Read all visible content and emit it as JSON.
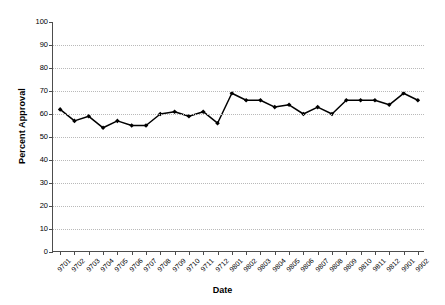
{
  "chart_data": {
    "type": "line",
    "title": "",
    "xlabel": "Date",
    "ylabel": "Percent Approval",
    "ylim": [
      0,
      100
    ],
    "ytick_step": 10,
    "yticks": [
      100,
      90,
      80,
      70,
      60,
      50,
      40,
      30,
      20,
      10,
      0
    ],
    "grid": true,
    "legend": "none",
    "marker": "filled-diamond",
    "line_color": "#000000",
    "marker_color": "#000000",
    "gridline_color": "#b9b9b9",
    "axis_color": "#4d4d4d",
    "background": "#ffffff",
    "categories": [
      "9701",
      "9702",
      "9703",
      "9704",
      "9705",
      "9706",
      "9707",
      "9708",
      "9709",
      "9710",
      "9711",
      "9712",
      "9801",
      "9802",
      "9803",
      "9804",
      "9805",
      "9806",
      "9807",
      "9808",
      "9809",
      "9810",
      "9811",
      "9812",
      "9901",
      "9902"
    ],
    "values": [
      62,
      57,
      59,
      54,
      57,
      55,
      55,
      60,
      61,
      59,
      61,
      56,
      69,
      66,
      66,
      63,
      64,
      60,
      63,
      60,
      66,
      66,
      66,
      64,
      69,
      66
    ]
  }
}
